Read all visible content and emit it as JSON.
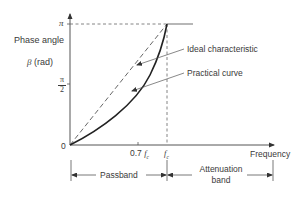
{
  "diagram": {
    "type": "phase-response",
    "y_axis": {
      "label_line1": "Phase angle",
      "label_symbol": "β",
      "label_unit": "(rad)",
      "ticks": {
        "pi": "π",
        "half_pi_num": "π",
        "half_pi_den": "2",
        "zero": "0"
      }
    },
    "x_axis": {
      "label": "Frequency",
      "ticks": {
        "p7fc_num": "0.7",
        "fc": "f",
        "fc_sub": "c"
      }
    },
    "curves": [
      {
        "name": "Ideal characteristic",
        "style": "dashed",
        "description": "straight line from origin to (fc, π)"
      },
      {
        "name": "Practical curve",
        "style": "solid",
        "description": "curved line from origin to (fc, π), below ideal"
      }
    ],
    "annotations": {
      "ideal": "Ideal characteristic",
      "practical": "Practical curve"
    },
    "bands": {
      "passband": "Passband",
      "attenuation_line1": "Attenuation",
      "attenuation_line2": "band"
    },
    "colors": {
      "line": "#333333",
      "dashed": "#555555",
      "flat": "#888888"
    }
  }
}
